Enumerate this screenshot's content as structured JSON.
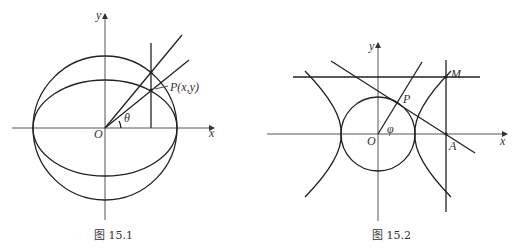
{
  "figures": [
    {
      "id": "fig-15-1",
      "caption": "图 15.1",
      "labels": {
        "y_axis": "y",
        "x_axis": "x",
        "origin": "O",
        "angle": "θ",
        "point": "P(x,y)"
      },
      "elements": [
        "x-axis",
        "y-axis",
        "circle",
        "ellipse",
        "vertical-line",
        "ray-to-circle",
        "ray-to-ellipse-point-P"
      ]
    },
    {
      "id": "fig-15-2",
      "caption": "图 15.2",
      "labels": {
        "y_axis": "y",
        "x_axis": "x",
        "origin": "O",
        "angle": "φ",
        "point_p": "P",
        "point_m": "M",
        "point_a": "A"
      },
      "elements": [
        "x-axis",
        "y-axis",
        "unit-circle",
        "hyperbola-left-branch",
        "hyperbola-right-branch",
        "horizontal-line-through-M",
        "vertical-line-through-A",
        "tangent-line-at-P",
        "radius-line-OP"
      ]
    }
  ]
}
